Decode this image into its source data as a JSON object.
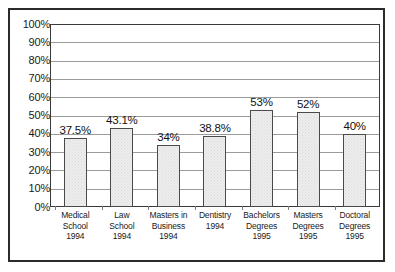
{
  "chart_data": {
    "type": "bar",
    "title": "",
    "subtitle": "",
    "xlabel": "",
    "ylabel": "",
    "ylim": [
      0,
      100
    ],
    "y_tick_labels": [
      "100%",
      "90%",
      "80%",
      "70%",
      "60%",
      "50%",
      "40%",
      "30%",
      "20%",
      "10%",
      "0%"
    ],
    "y_tick_values": [
      100,
      90,
      80,
      70,
      60,
      50,
      40,
      30,
      20,
      10,
      0
    ],
    "grid": true,
    "legend": "none",
    "categories": [
      "Medical School 1994",
      "Law School 1994",
      "Masters in Business 1994",
      "Dentistry 1994",
      "Bachelors Degrees 1995",
      "Masters Degrees 1995",
      "Doctoral Degrees 1995"
    ],
    "category_lines": [
      [
        "Medical",
        "School",
        "1994"
      ],
      [
        "Law School",
        "1994"
      ],
      [
        "Masters in",
        "Business",
        "1994"
      ],
      [
        "Dentistry",
        "1994"
      ],
      [
        "Bachelors",
        "Degrees",
        "1995"
      ],
      [
        "Masters",
        "Degrees",
        "1995"
      ],
      [
        "Doctoral",
        "Degrees",
        "1995"
      ]
    ],
    "values": [
      37.5,
      43.1,
      34,
      38.8,
      53,
      52,
      40
    ],
    "value_labels": [
      "37.5%",
      "43.1%",
      "34%",
      "38.8%",
      "53%",
      "52%",
      "40%"
    ],
    "colors": {
      "bar_fill": "#ededed",
      "bar_border": "#4a4a4a",
      "gridline": "#9b9b9b",
      "plot_border": "#3a3a3a",
      "frame_border": "#2b2b2b",
      "text": "#1a1a1a",
      "background": "#ffffff"
    }
  }
}
